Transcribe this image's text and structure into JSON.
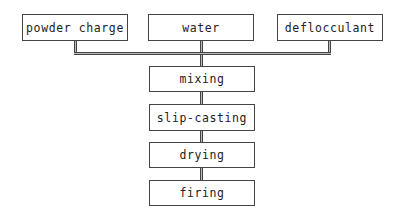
{
  "diagram": {
    "inputs": [
      {
        "label": "powder charge"
      },
      {
        "label": "water"
      },
      {
        "label": "deflocculant"
      }
    ],
    "steps": [
      {
        "label": "mixing"
      },
      {
        "label": "slip-casting"
      },
      {
        "label": "drying"
      },
      {
        "label": "firing"
      }
    ]
  }
}
